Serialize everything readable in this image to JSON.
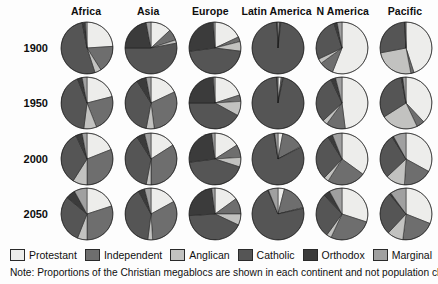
{
  "columns": [
    "Africa",
    "Asia",
    "Europe",
    "Latin America",
    "N America",
    "Pacific"
  ],
  "rows": [
    "1900",
    "1950",
    "2000",
    "2050"
  ],
  "legend": [
    {
      "label": "Protestant",
      "color": "#ededeb"
    },
    {
      "label": "Independent",
      "color": "#6e6e6e"
    },
    {
      "label": "Anglican",
      "color": "#c2c2c0"
    },
    {
      "label": "Catholic",
      "color": "#555555"
    },
    {
      "label": "Orthodox",
      "color": "#3b3b3b"
    },
    {
      "label": "Marginal",
      "color": "#a0a0a0"
    }
  ],
  "note": "Note: Proportions of the Christian megablocs are shown in each continent and not population changes",
  "chart_data": {
    "type": "pie",
    "title": "",
    "subtitle": "",
    "xlabel": "",
    "ylabel": "",
    "grid": false,
    "legend_position": "bottom",
    "small_multiples": true,
    "columns": [
      "Africa",
      "Asia",
      "Europe",
      "Latin America",
      "N America",
      "Pacific"
    ],
    "rows": [
      "1900",
      "1950",
      "2000",
      "2050"
    ],
    "categories": [
      "Protestant",
      "Independent",
      "Anglican",
      "Catholic",
      "Orthodox",
      "Marginal"
    ],
    "colors": [
      "#ededeb",
      "#6e6e6e",
      "#c2c2c0",
      "#555555",
      "#3b3b3b",
      "#a0a0a0"
    ],
    "start_angle_deg": -90,
    "direction": "clockwise",
    "units": "percent of Christian population",
    "panels": [
      {
        "continent": "Africa",
        "year": "1900",
        "values": [
          24,
          17,
          4,
          52,
          2,
          1
        ]
      },
      {
        "continent": "Africa",
        "year": "1950",
        "values": [
          21,
          23,
          8,
          42,
          3,
          3
        ]
      },
      {
        "continent": "Africa",
        "year": "2000",
        "values": [
          19,
          31,
          9,
          34,
          4,
          3
        ]
      },
      {
        "continent": "Africa",
        "year": "2050",
        "values": [
          20,
          30,
          6,
          30,
          6,
          8
        ]
      },
      {
        "continent": "Asia",
        "year": "1900",
        "values": [
          13,
          7,
          2,
          53,
          22,
          3
        ]
      },
      {
        "continent": "Asia",
        "year": "1950",
        "values": [
          18,
          30,
          5,
          38,
          6,
          3
        ]
      },
      {
        "continent": "Asia",
        "year": "2000",
        "values": [
          16,
          34,
          3,
          38,
          5,
          4
        ]
      },
      {
        "continent": "Asia",
        "year": "2050",
        "values": [
          17,
          32,
          3,
          40,
          4,
          4
        ]
      },
      {
        "continent": "Europe",
        "year": "1900",
        "values": [
          18,
          3,
          6,
          46,
          26,
          1
        ]
      },
      {
        "continent": "Europe",
        "year": "1950",
        "values": [
          20,
          4,
          9,
          42,
          24,
          1
        ]
      },
      {
        "continent": "Europe",
        "year": "2000",
        "values": [
          16,
          8,
          6,
          43,
          25,
          2
        ]
      },
      {
        "continent": "Europe",
        "year": "2050",
        "values": [
          15,
          10,
          7,
          42,
          24,
          2
        ]
      },
      {
        "continent": "Latin America",
        "year": "1900",
        "values": [
          1,
          0.5,
          0.3,
          97.5,
          0.2,
          0.5
        ]
      },
      {
        "continent": "Latin America",
        "year": "1950",
        "values": [
          2,
          1,
          0.3,
          96,
          0.2,
          0.5
        ]
      },
      {
        "continent": "Latin America",
        "year": "2000",
        "values": [
          3,
          14,
          0.5,
          80,
          0.5,
          2
        ]
      },
      {
        "continent": "Latin America",
        "year": "2050",
        "values": [
          4,
          17,
          0.5,
          72,
          0.5,
          6
        ]
      },
      {
        "continent": "N America",
        "year": "1900",
        "values": [
          56,
          9,
          3,
          27,
          2,
          3
        ]
      },
      {
        "continent": "N America",
        "year": "1950",
        "values": [
          48,
          12,
          3,
          30,
          3,
          4
        ]
      },
      {
        "continent": "N America",
        "year": "2000",
        "values": [
          35,
          24,
          3,
          29,
          3,
          6
        ]
      },
      {
        "continent": "N America",
        "year": "2050",
        "values": [
          30,
          27,
          3,
          28,
          4,
          8
        ]
      },
      {
        "continent": "Pacific",
        "year": "1900",
        "values": [
          45,
          2,
          25,
          27,
          0.5,
          0.5
        ]
      },
      {
        "continent": "Pacific",
        "year": "1950",
        "values": [
          38,
          5,
          23,
          31,
          1,
          2
        ]
      },
      {
        "continent": "Pacific",
        "year": "2000",
        "values": [
          33,
          18,
          12,
          28,
          1,
          8
        ]
      },
      {
        "continent": "Pacific",
        "year": "2050",
        "values": [
          31,
          21,
          10,
          27,
          1,
          10
        ]
      }
    ]
  }
}
